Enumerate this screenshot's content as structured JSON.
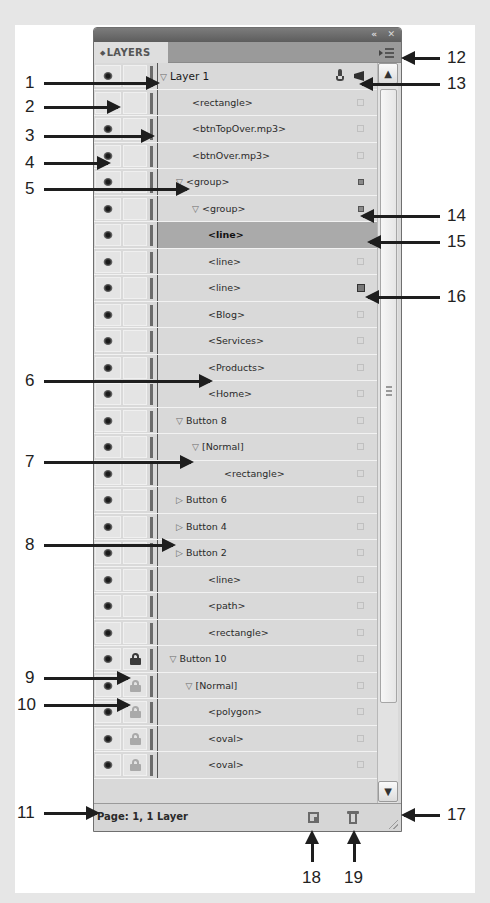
{
  "panel": {
    "tab_label": "LAYERS",
    "tab_prefix_glyph": "◆",
    "collapse_glyph": "«",
    "close_glyph": "✕",
    "status_text": "Page: 1, 1 Layer",
    "scroll_up_glyph": "▲",
    "scroll_down_glyph": "▼"
  },
  "rows": [
    {
      "label": "Layer 1",
      "indent": 0,
      "disclosure": "▽",
      "eye": true,
      "lock": "none",
      "marker": "pen",
      "top_layer": true
    },
    {
      "label": "<rectangle>",
      "indent": 2,
      "disclosure": "",
      "eye": false,
      "lock": "none",
      "marker": "empty"
    },
    {
      "label": "<btnTopOver.mp3>",
      "indent": 2,
      "disclosure": "",
      "eye": true,
      "lock": "none",
      "marker": "empty"
    },
    {
      "label": "<btnOver.mp3>",
      "indent": 2,
      "disclosure": "",
      "eye": true,
      "lock": "none",
      "marker": "empty"
    },
    {
      "label": "<group>",
      "indent": 1,
      "disclosure": "▽",
      "eye": true,
      "lock": "none",
      "marker": "small"
    },
    {
      "label": "<group>",
      "indent": 2,
      "disclosure": "▽",
      "eye": true,
      "lock": "none",
      "marker": "small"
    },
    {
      "label": "<line>",
      "indent": 3,
      "disclosure": "",
      "eye": true,
      "lock": "none",
      "marker": "none",
      "selected": true
    },
    {
      "label": "<line>",
      "indent": 3,
      "disclosure": "",
      "eye": true,
      "lock": "none",
      "marker": "empty"
    },
    {
      "label": "<line>",
      "indent": 3,
      "disclosure": "",
      "eye": true,
      "lock": "none",
      "marker": "large"
    },
    {
      "label": "<Blog>",
      "indent": 3,
      "disclosure": "",
      "eye": true,
      "lock": "none",
      "marker": "empty"
    },
    {
      "label": "<Services>",
      "indent": 3,
      "disclosure": "",
      "eye": true,
      "lock": "none",
      "marker": "empty"
    },
    {
      "label": "<Products>",
      "indent": 3,
      "disclosure": "",
      "eye": true,
      "lock": "none",
      "marker": "empty"
    },
    {
      "label": "<Home>",
      "indent": 3,
      "disclosure": "",
      "eye": true,
      "lock": "none",
      "marker": "empty"
    },
    {
      "label": "Button 8",
      "indent": 1,
      "disclosure": "▽",
      "eye": true,
      "lock": "none",
      "marker": "empty"
    },
    {
      "label": "[Normal]",
      "indent": 2,
      "disclosure": "▽",
      "eye": true,
      "lock": "none",
      "marker": "empty"
    },
    {
      "label": "<rectangle>",
      "indent": 4,
      "disclosure": "",
      "eye": true,
      "lock": "none",
      "marker": "empty"
    },
    {
      "label": "Button 6",
      "indent": 1,
      "disclosure": "▷",
      "eye": true,
      "lock": "none",
      "marker": "empty"
    },
    {
      "label": "Button 4",
      "indent": 1,
      "disclosure": "▷",
      "eye": true,
      "lock": "none",
      "marker": "empty"
    },
    {
      "label": "Button 2",
      "indent": 1,
      "disclosure": "▷",
      "eye": true,
      "lock": "none",
      "marker": "empty"
    },
    {
      "label": "<line>",
      "indent": 3,
      "disclosure": "",
      "eye": true,
      "lock": "none",
      "marker": "empty"
    },
    {
      "label": "<path>",
      "indent": 3,
      "disclosure": "",
      "eye": true,
      "lock": "none",
      "marker": "empty"
    },
    {
      "label": "<rectangle>",
      "indent": 3,
      "disclosure": "",
      "eye": true,
      "lock": "none",
      "marker": "empty"
    },
    {
      "label": "Button 10",
      "indent": 0.6,
      "disclosure": "▽",
      "eye": true,
      "lock": "locked",
      "marker": "empty"
    },
    {
      "label": "[Normal]",
      "indent": 1.6,
      "disclosure": "▽",
      "eye": true,
      "lock": "inherited",
      "marker": "empty"
    },
    {
      "label": "<polygon>",
      "indent": 3,
      "disclosure": "",
      "eye": true,
      "lock": "inherited",
      "marker": "empty"
    },
    {
      "label": "<oval>",
      "indent": 3,
      "disclosure": "",
      "eye": true,
      "lock": "inherited",
      "marker": "empty"
    },
    {
      "label": "<oval>",
      "indent": 3,
      "disclosure": "",
      "eye": true,
      "lock": "inherited",
      "marker": "empty"
    }
  ],
  "callouts": [
    {
      "num": "1",
      "side": "left",
      "y": 83,
      "arrow_to": 157
    },
    {
      "num": "2",
      "side": "left",
      "y": 107,
      "arrow_to": 118
    },
    {
      "num": "3",
      "side": "left",
      "y": 136,
      "arrow_to": 152
    },
    {
      "num": "4",
      "side": "left",
      "y": 163,
      "arrow_to": 108
    },
    {
      "num": "5",
      "side": "left",
      "y": 189,
      "arrow_to": 187
    },
    {
      "num": "6",
      "side": "left",
      "y": 381,
      "arrow_to": 210
    },
    {
      "num": "7",
      "side": "left",
      "y": 462,
      "arrow_to": 191
    },
    {
      "num": "8",
      "side": "left",
      "y": 545,
      "arrow_to": 173
    },
    {
      "num": "9",
      "side": "left",
      "y": 678,
      "arrow_to": 128
    },
    {
      "num": "10",
      "side": "left",
      "y": 705,
      "arrow_to": 128
    },
    {
      "num": "11",
      "side": "left",
      "y": 813,
      "arrow_to": 97
    },
    {
      "num": "12",
      "side": "right",
      "y": 58,
      "arrow_from": 404
    },
    {
      "num": "13",
      "side": "right",
      "y": 84,
      "arrow_from": 362
    },
    {
      "num": "14",
      "side": "right",
      "y": 216,
      "arrow_from": 363
    },
    {
      "num": "15",
      "side": "right",
      "y": 242,
      "arrow_from": 370
    },
    {
      "num": "16",
      "side": "right",
      "y": 297,
      "arrow_from": 368
    },
    {
      "num": "17",
      "side": "right",
      "y": 815,
      "arrow_from": 404
    }
  ],
  "bottom_callouts": [
    {
      "num": "18",
      "x": 312
    },
    {
      "num": "19",
      "x": 354
    }
  ],
  "colors": {
    "selected_row": "#aaaaaa",
    "panel_bg": "#d9d9d9",
    "titlebar": "#666666",
    "tabrow": "#9a9a9a",
    "lock_locked": "#3a3a3a",
    "lock_inherited": "#a9a9a9"
  }
}
